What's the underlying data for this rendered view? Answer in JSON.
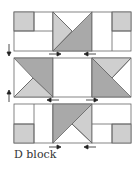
{
  "caption": "D block",
  "colors": {
    "dark_gray": "#a9a9a9",
    "light_gray": "#cfcfcf",
    "outline": "#666666",
    "white": "#ffffff",
    "arrow": "#222222"
  },
  "rows": [
    {
      "name": "top-row",
      "units": [
        "corner-square-gray-top-left",
        "hourglass-triangle-unit",
        "corner-square-gray-top-right"
      ]
    },
    {
      "name": "middle-row",
      "units": [
        "triangle-unit-left",
        "plain-center-square",
        "triangle-unit-right"
      ]
    },
    {
      "name": "bottom-row",
      "units": [
        "corner-square-gray-bottom-left",
        "hourglass-triangle-unit",
        "corner-square-gray-bottom-right"
      ]
    }
  ],
  "arrows": {
    "left_side": [
      "down",
      "up"
    ],
    "seam_1": [
      "right",
      "left"
    ],
    "seam_2": [
      "left",
      "right"
    ],
    "seam_3": [
      "right",
      "left"
    ]
  }
}
